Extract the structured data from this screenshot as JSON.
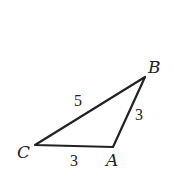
{
  "diagram": {
    "type": "triangle",
    "vertices": [
      {
        "name": "A",
        "x": 113,
        "y": 147
      },
      {
        "name": "B",
        "x": 145,
        "y": 77
      },
      {
        "name": "C",
        "x": 35,
        "y": 145
      }
    ],
    "labels": {
      "A": "A",
      "B": "B",
      "C": "C"
    },
    "side_lengths": {
      "CB": "5",
      "BA": "3",
      "CA": "3"
    },
    "stroke_color": "#222222"
  }
}
